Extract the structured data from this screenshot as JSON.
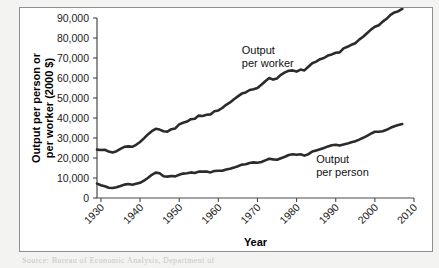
{
  "figure": {
    "background": "#ffffff",
    "frame_color": "#8f8f93",
    "page_background": "#f3f3f1",
    "line_color": "#2b2b2b",
    "caption_partial": "Source: Bureau of Economic Analysis, Department of"
  },
  "chart_data": {
    "type": "line",
    "title": "",
    "xlabel": "Year",
    "ylabel": "Output per person or\nper worker (2000 $)",
    "ylabel_line1": "Output per person or",
    "ylabel_line2": "per worker (2000 $)",
    "xlim": [
      1929,
      2010
    ],
    "ylim": [
      0,
      90000
    ],
    "grid": false,
    "legend": "inline-annotations",
    "xticks": [
      1930,
      1940,
      1950,
      1960,
      1970,
      1980,
      1990,
      2000,
      2010
    ],
    "xtick_labels": [
      "1930",
      "1940",
      "1950",
      "1960",
      "1970",
      "1980",
      "1990",
      "2000",
      "2010"
    ],
    "xtick_rotation": -45,
    "yticks": [
      0,
      10000,
      20000,
      30000,
      40000,
      50000,
      60000,
      70000,
      80000,
      90000
    ],
    "ytick_labels": [
      "0",
      "10,000",
      "20,000",
      "30,000",
      "40,000",
      "50,000",
      "60,000",
      "70,000",
      "80,000",
      "90,000"
    ],
    "annotations": [
      {
        "text_line1": "Output",
        "text_line2": "per worker",
        "x": 1966,
        "y": 72000
      },
      {
        "text_line1": "Output",
        "text_line2": "per person",
        "x": 1985,
        "y": 17500
      }
    ],
    "series": [
      {
        "name": "Output per worker",
        "x": [
          1929,
          1930,
          1931,
          1932,
          1933,
          1934,
          1935,
          1936,
          1937,
          1938,
          1939,
          1940,
          1941,
          1942,
          1943,
          1944,
          1945,
          1946,
          1947,
          1948,
          1949,
          1950,
          1951,
          1952,
          1953,
          1954,
          1955,
          1956,
          1957,
          1958,
          1959,
          1960,
          1961,
          1962,
          1963,
          1964,
          1965,
          1966,
          1967,
          1968,
          1969,
          1970,
          1971,
          1972,
          1973,
          1974,
          1975,
          1976,
          1977,
          1978,
          1979,
          1980,
          1981,
          1982,
          1983,
          1984,
          1985,
          1986,
          1987,
          1988,
          1989,
          1990,
          1991,
          1992,
          1993,
          1994,
          1995,
          1996,
          1997,
          1998,
          1999,
          2000,
          2001,
          2002,
          2003,
          2004,
          2005,
          2006,
          2007
        ],
        "values": [
          24200,
          24000,
          24100,
          23200,
          22800,
          23400,
          24600,
          25600,
          25800,
          25600,
          26600,
          28000,
          29800,
          31800,
          33400,
          34600,
          34200,
          33400,
          33200,
          34400,
          34800,
          36800,
          37600,
          38200,
          39400,
          39600,
          41200,
          41000,
          41600,
          41800,
          43400,
          43800,
          45000,
          46600,
          47800,
          49400,
          50800,
          52200,
          52800,
          54000,
          54400,
          55000,
          56600,
          58400,
          60000,
          59200,
          59800,
          61600,
          62800,
          63600,
          63800,
          63200,
          64200,
          63800,
          65600,
          67400,
          68200,
          69400,
          70000,
          71200,
          71800,
          72600,
          72800,
          74800,
          75600,
          76600,
          77400,
          79200,
          80600,
          82400,
          84200,
          85600,
          86400,
          88200,
          89600,
          91600,
          92800,
          93400,
          94600
        ]
      },
      {
        "name": "Output per person",
        "x": [
          1929,
          1930,
          1931,
          1932,
          1933,
          1934,
          1935,
          1936,
          1937,
          1938,
          1939,
          1940,
          1941,
          1942,
          1943,
          1944,
          1945,
          1946,
          1947,
          1948,
          1949,
          1950,
          1951,
          1952,
          1953,
          1954,
          1955,
          1956,
          1957,
          1958,
          1959,
          1960,
          1961,
          1962,
          1963,
          1964,
          1965,
          1966,
          1967,
          1968,
          1969,
          1970,
          1971,
          1972,
          1973,
          1974,
          1975,
          1976,
          1977,
          1978,
          1979,
          1980,
          1981,
          1982,
          1983,
          1984,
          1985,
          1986,
          1987,
          1988,
          1989,
          1990,
          1991,
          1992,
          1993,
          1994,
          1995,
          1996,
          1997,
          1998,
          1999,
          2000,
          2001,
          2002,
          2003,
          2004,
          2005,
          2006,
          2007
        ],
        "values": [
          7200,
          6400,
          5900,
          5100,
          5000,
          5400,
          6000,
          6700,
          7000,
          6600,
          7100,
          7600,
          8700,
          10000,
          11600,
          12700,
          12400,
          10900,
          10700,
          11000,
          10800,
          11600,
          12200,
          12400,
          12800,
          12500,
          13200,
          13200,
          13200,
          12800,
          13500,
          13600,
          13600,
          14200,
          14600,
          15200,
          15900,
          16700,
          16900,
          17500,
          17800,
          17600,
          18000,
          18800,
          19600,
          19300,
          19100,
          19900,
          20600,
          21500,
          21900,
          21600,
          21900,
          21200,
          21900,
          23200,
          23800,
          24400,
          25000,
          25800,
          26400,
          26600,
          26200,
          26800,
          27200,
          27900,
          28400,
          29200,
          30100,
          31100,
          32200,
          33100,
          33100,
          33400,
          34100,
          35100,
          35900,
          36500,
          37000
        ]
      }
    ]
  }
}
